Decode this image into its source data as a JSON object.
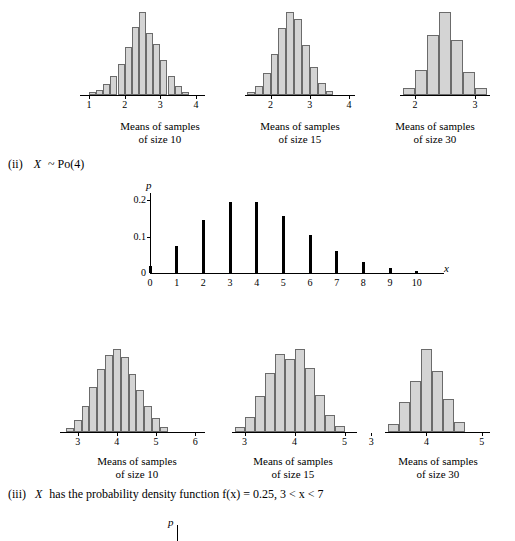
{
  "sections": [
    {
      "id": "ii",
      "marker": "(ii)",
      "text": "X ~ Po(4)",
      "var": "X",
      "rest": "~ Po(4)"
    },
    {
      "id": "iii",
      "marker": "(iii)",
      "text": "X has the probability density function f(x) = 0.25,  3 < x < 7",
      "var": "X",
      "rest": "has the probability density function f(x) = 0.25,  3 < x < 7"
    }
  ],
  "captions": {
    "size10": {
      "line1": "Means of samples",
      "line2": "of size 10"
    },
    "size15": {
      "line1": "Means of samples",
      "line2": "of size 15"
    },
    "size30": {
      "line1": "Means of samples",
      "line2": "of size 30"
    }
  },
  "axis_labels": {
    "p": "p",
    "x": "x"
  },
  "chart_data": [
    {
      "id": "top-hist-10",
      "type": "bar",
      "title": "Means of samples of size 10",
      "xlabel": "",
      "ylabel": "",
      "xticks": [
        1,
        2,
        3,
        4
      ],
      "categories": [
        1.1,
        1.3,
        1.5,
        1.7,
        1.9,
        2.1,
        2.3,
        2.5,
        2.7,
        2.9,
        3.1,
        3.3,
        3.5,
        3.7
      ],
      "values": [
        3,
        6,
        13,
        22,
        36,
        55,
        79,
        96,
        72,
        59,
        40,
        22,
        10,
        4
      ]
    },
    {
      "id": "top-hist-15",
      "type": "bar",
      "title": "Means of samples of size 15",
      "xlabel": "",
      "ylabel": "",
      "xticks": [
        2,
        3,
        4
      ],
      "categories": [
        1.5,
        1.7,
        1.9,
        2.1,
        2.3,
        2.5,
        2.7,
        2.9,
        3.1,
        3.3,
        3.5
      ],
      "values": [
        4,
        10,
        25,
        48,
        78,
        96,
        88,
        58,
        32,
        14,
        5
      ]
    },
    {
      "id": "top-hist-30",
      "type": "bar",
      "title": "Means of samples of size 30",
      "xlabel": "",
      "ylabel": "",
      "xticks": [
        2,
        3
      ],
      "categories": [
        1.9,
        2.1,
        2.3,
        2.5,
        2.7,
        2.9,
        3.1
      ],
      "values": [
        8,
        30,
        72,
        100,
        66,
        28,
        8
      ]
    },
    {
      "id": "poisson-pmf",
      "type": "bar",
      "title": "X ~ Po(4) probability function",
      "xlabel": "x",
      "ylabel": "p",
      "x": [
        0,
        1,
        2,
        3,
        4,
        5,
        6,
        7,
        8,
        9,
        10
      ],
      "values": [
        0.018,
        0.073,
        0.147,
        0.195,
        0.195,
        0.156,
        0.104,
        0.06,
        0.03,
        0.013,
        0.005
      ],
      "yticks": [
        0,
        0.1,
        0.2
      ],
      "ylim": [
        0,
        0.22
      ],
      "xlim": [
        0,
        10.5
      ]
    },
    {
      "id": "bottom-hist-10",
      "type": "bar",
      "title": "Means of samples of size 10",
      "xlabel": "",
      "ylabel": "",
      "xticks": [
        3,
        4,
        5,
        6
      ],
      "categories": [
        2.8,
        3.0,
        3.2,
        3.4,
        3.6,
        3.8,
        4.0,
        4.2,
        4.4,
        4.6,
        4.8,
        5.0,
        5.2
      ],
      "values": [
        5,
        14,
        30,
        52,
        72,
        88,
        95,
        86,
        66,
        48,
        30,
        16,
        6
      ]
    },
    {
      "id": "bottom-hist-15",
      "type": "bar",
      "title": "Means of samples of size 15",
      "xlabel": "",
      "ylabel": "",
      "xticks": [
        3,
        4,
        5
      ],
      "categories": [
        2.9,
        3.1,
        3.3,
        3.5,
        3.7,
        3.9,
        4.1,
        4.3,
        4.5,
        4.7,
        4.9
      ],
      "values": [
        6,
        18,
        42,
        70,
        92,
        86,
        98,
        76,
        44,
        20,
        7
      ]
    },
    {
      "id": "bottom-hist-30",
      "type": "bar",
      "title": "Means of samples of size 30",
      "xlabel": "",
      "ylabel": "",
      "xticks": [
        3,
        4,
        5
      ],
      "categories": [
        3.4,
        3.6,
        3.8,
        4.0,
        4.2,
        4.4,
        4.6
      ],
      "values": [
        10,
        36,
        62,
        100,
        74,
        40,
        12
      ]
    }
  ]
}
